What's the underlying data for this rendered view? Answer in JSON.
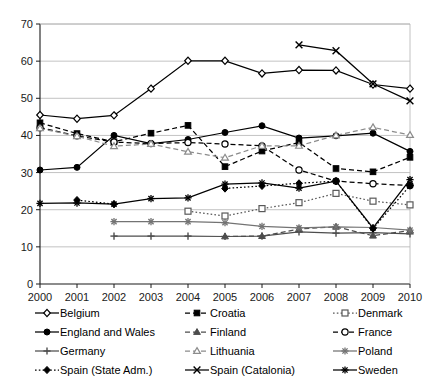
{
  "chart_data": {
    "type": "line",
    "title": "",
    "xlabel": "",
    "ylabel": "",
    "categories": [
      "2000",
      "2001",
      "2002",
      "2003",
      "2004",
      "2005",
      "2006",
      "2007",
      "2008",
      "2009",
      "2010"
    ],
    "x": [
      2000,
      2001,
      2002,
      2003,
      2004,
      2005,
      2006,
      2007,
      2008,
      2009,
      2010
    ],
    "xlim": [
      2000,
      2010
    ],
    "ylim": [
      0,
      70
    ],
    "yticks": [
      0,
      10,
      20,
      30,
      40,
      50,
      60,
      70
    ],
    "grid": "horizontal",
    "legend_position": "bottom",
    "legend_columns": 3,
    "series": [
      {
        "name": "Belgium",
        "marker": "diamond-open",
        "line": "solid",
        "color": "#000000",
        "values": [
          45.5,
          44.5,
          45.4,
          52.6,
          60.1,
          60.1,
          56.7,
          57.6,
          57.5,
          53.7,
          52.6
        ]
      },
      {
        "name": "Croatia",
        "marker": "square-filled",
        "line": "dashed",
        "color": "#000000",
        "values": [
          43.4,
          40.5,
          38.3,
          40.6,
          42.7,
          31.6,
          35.8,
          38.1,
          31.1,
          30.2,
          34.1
        ]
      },
      {
        "name": "Denmark",
        "marker": "square-open",
        "line": "dotted",
        "color": "#595959",
        "values": [
          null,
          null,
          null,
          null,
          19.6,
          18.3,
          20.3,
          21.9,
          24.4,
          22.3,
          21.3
        ]
      },
      {
        "name": "England and Wales",
        "marker": "circle-filled",
        "line": "solid",
        "color": "#000000",
        "values": [
          30.7,
          31.4,
          40.0,
          37.8,
          38.9,
          40.8,
          42.6,
          39.3,
          39.9,
          40.6,
          35.7
        ]
      },
      {
        "name": "Finland",
        "marker": "triangle-filled",
        "line": "dashed",
        "color": "#4d4d4d",
        "values": [
          null,
          null,
          null,
          null,
          null,
          12.8,
          12.9,
          14.8,
          15.4,
          13.0,
          14.4
        ]
      },
      {
        "name": "France",
        "marker": "circle-open",
        "line": "dashed",
        "color": "#000000",
        "values": [
          42.1,
          39.9,
          38.2,
          37.8,
          38.1,
          37.7,
          37.2,
          30.7,
          27.7,
          27.0,
          26.5
        ]
      },
      {
        "name": "Germany",
        "marker": "plus",
        "line": "solid",
        "color": "#4d4d4d",
        "values": [
          null,
          null,
          12.9,
          12.9,
          12.9,
          12.8,
          12.9,
          14.0,
          13.7,
          13.8,
          13.5
        ]
      },
      {
        "name": "Lithuania",
        "marker": "triangle-open",
        "line": "dashed",
        "color": "#8c8c8c",
        "values": [
          41.9,
          39.8,
          37.1,
          37.7,
          35.6,
          34.0,
          37.2,
          37.2,
          40.0,
          42.2,
          40.1
        ]
      },
      {
        "name": "Poland",
        "marker": "asterisk-gray",
        "line": "solid",
        "color": "#737373",
        "values": [
          null,
          null,
          16.8,
          16.8,
          16.8,
          16.5,
          15.5,
          15.1,
          15.4,
          15.2,
          14.5
        ]
      },
      {
        "name": "Spain (State Adm.)",
        "marker": "diamond-filled",
        "line": "dotted",
        "color": "#000000",
        "values": [
          null,
          22.6,
          21.5,
          null,
          null,
          25.7,
          26.4,
          27.1,
          27.7,
          14.9,
          26.5
        ]
      },
      {
        "name": "Spain (Catalonia)",
        "marker": "x-cross",
        "line": "solid",
        "color": "#000000",
        "values": [
          null,
          null,
          null,
          null,
          null,
          null,
          null,
          64.4,
          62.8,
          53.9,
          49.3
        ]
      },
      {
        "name": "Sweden",
        "marker": "asterisk",
        "line": "solid",
        "color": "#000000",
        "values": [
          21.7,
          21.8,
          21.5,
          23.0,
          23.2,
          26.9,
          27.2,
          25.8,
          27.7,
          15.1,
          28.1
        ]
      }
    ]
  },
  "legend": {
    "items": [
      {
        "label": "Belgium"
      },
      {
        "label": "Croatia"
      },
      {
        "label": "Denmark"
      },
      {
        "label": "England and Wales"
      },
      {
        "label": "Finland"
      },
      {
        "label": "France"
      },
      {
        "label": "Germany"
      },
      {
        "label": "Lithuania"
      },
      {
        "label": "Poland"
      },
      {
        "label": "Spain (State Adm.)"
      },
      {
        "label": "Spain (Catalonia)"
      },
      {
        "label": "Sweden"
      }
    ],
    "order": [
      "Belgium",
      "Croatia",
      "Denmark",
      "England and Wales",
      "Finland",
      "France",
      "Germany",
      "Lithuania",
      "Poland",
      "Spain (State Adm.)",
      "Spain (Catalonia)",
      "Sweden"
    ]
  },
  "colors": {
    "axis": "#1a1a1a",
    "grid": "#b3b3b3",
    "background": "#ffffff"
  }
}
